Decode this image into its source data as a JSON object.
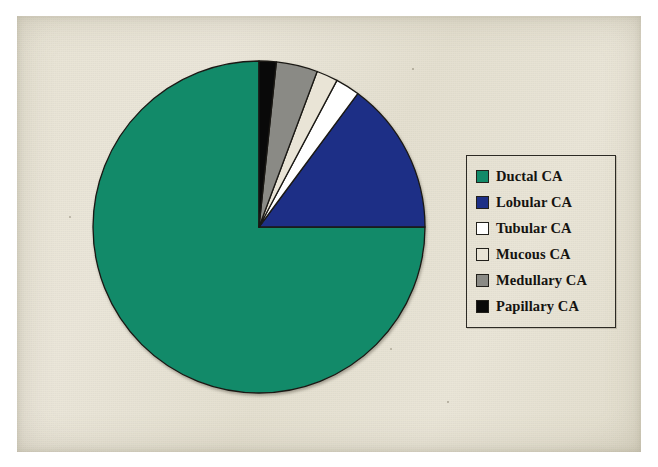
{
  "figure": {
    "background_color": "#ffffff",
    "plate_color": "#e8e3d4"
  },
  "legend": {
    "name": "chart-legend",
    "border_color": "#2c2a24",
    "items": [
      {
        "label": "Ductal CA",
        "color": "#128a69",
        "swatch_name": "legend-swatch-ductal"
      },
      {
        "label": "Lobular CA",
        "color": "#1d2f86",
        "swatch_name": "legend-swatch-lobular"
      },
      {
        "label": "Tubular CA",
        "color": "#ffffff",
        "swatch_name": "legend-swatch-tubular"
      },
      {
        "label": "Mucous CA",
        "color": "#e9e4d6",
        "swatch_name": "legend-swatch-mucous"
      },
      {
        "label": "Medullary CA",
        "color": "#8a8a85",
        "swatch_name": "legend-swatch-medullary"
      },
      {
        "label": "Papillary CA",
        "color": "#090909",
        "swatch_name": "legend-swatch-papillary"
      }
    ]
  },
  "chart_data": {
    "type": "pie",
    "title": "",
    "subtitle": "",
    "xlabel": "",
    "ylabel": "",
    "grid": false,
    "legend_position": "right",
    "start_angle_deg": 0,
    "direction": "counterclockwise",
    "center_px": [
      252,
      227
    ],
    "radius_px": 163,
    "categories": [
      "Ductal CA",
      "Lobular CA",
      "Tubular CA",
      "Mucous CA",
      "Medullary CA",
      "Papillary CA"
    ],
    "values": [
      75.0,
      14.9,
      2.4,
      2.1,
      4.0,
      1.6
    ],
    "unit": "%",
    "slice_angles_deg": [
      270.0,
      53.5,
      8.5,
      7.5,
      14.5,
      6.0
    ],
    "colors": [
      "#128a69",
      "#1d2f86",
      "#ffffff",
      "#e9e4d6",
      "#8a8a85",
      "#090909"
    ],
    "slices": [
      {
        "label": "Ductal CA",
        "value": 75.0,
        "angle_deg": 270.0,
        "color": "#128a69"
      },
      {
        "label": "Lobular CA",
        "value": 14.9,
        "angle_deg": 53.5,
        "color": "#1d2f86"
      },
      {
        "label": "Tubular CA",
        "value": 2.4,
        "angle_deg": 8.5,
        "color": "#ffffff"
      },
      {
        "label": "Mucous CA",
        "value": 2.1,
        "angle_deg": 7.5,
        "color": "#e9e4d6"
      },
      {
        "label": "Medullary CA",
        "value": 4.0,
        "angle_deg": 14.5,
        "color": "#8a8a85"
      },
      {
        "label": "Papillary CA",
        "value": 1.6,
        "angle_deg": 6.0,
        "color": "#090909"
      }
    ]
  }
}
